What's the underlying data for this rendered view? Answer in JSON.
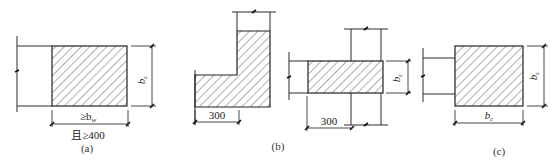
{
  "diagram": {
    "panels": [
      {
        "id": "a",
        "caption": "(a)",
        "dims": {
          "height": "b",
          "height_sub": "c",
          "width_line1": "≥b",
          "width_line1_sub": "w",
          "width_line2": "且≥400"
        }
      },
      {
        "id": "b",
        "caption": "(b)",
        "left_figure": {
          "dim_width": "300"
        },
        "right_figure": {
          "dim_width": "300",
          "dim_height": "b",
          "dim_height_sub": "c"
        }
      },
      {
        "id": "c",
        "caption": "(c)",
        "dims": {
          "height": "b",
          "height_sub": "c",
          "width": "b",
          "width_sub": "c"
        }
      }
    ],
    "colors": {
      "line": "#2a2a2a",
      "hatch": "#333333",
      "background": "#ffffff"
    }
  }
}
